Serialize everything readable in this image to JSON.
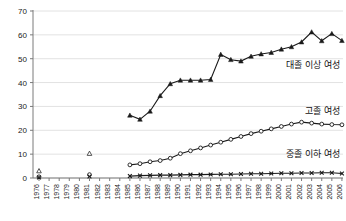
{
  "chart_data": {
    "type": "line",
    "title": "",
    "xlabel": "",
    "ylabel": "",
    "ylim": [
      0,
      70
    ],
    "yticks": [
      0,
      10,
      20,
      30,
      40,
      50,
      60,
      70
    ],
    "grid": true,
    "legend_position": "inline-right",
    "x": [
      1976,
      1977,
      1978,
      1979,
      1980,
      1981,
      1982,
      1983,
      1984,
      1985,
      1986,
      1987,
      1988,
      1989,
      1990,
      1991,
      1992,
      1993,
      1994,
      1995,
      1996,
      1997,
      1998,
      1999,
      2000,
      2001,
      2002,
      2003,
      2004,
      2005,
      2006
    ],
    "categories": [
      "1976",
      "1977",
      "1978",
      "1979",
      "1980",
      "1981",
      "1982",
      "1983",
      "1984",
      "1985",
      "1986",
      "1987",
      "1988",
      "1989",
      "1990",
      "1991",
      "1992",
      "1993",
      "1994",
      "1995",
      "1996",
      "1997",
      "1998",
      "1999",
      "2000",
      "2001",
      "2002",
      "2003",
      "2004",
      "2005",
      "2006"
    ],
    "series": [
      {
        "name": "대졸 이상 여성",
        "marker": "triangle",
        "label_anchor_year": 2001,
        "label_anchor_value": 46,
        "values": [
          3.0,
          null,
          null,
          null,
          null,
          10.3,
          null,
          null,
          null,
          26.3,
          24.6,
          28.0,
          34.5,
          39.5,
          41.0,
          41.0,
          41.0,
          41.3,
          51.8,
          49.6,
          49.0,
          51.0,
          52.0,
          52.6,
          54.0,
          55.0,
          57.0,
          61.2,
          57.5,
          60.5,
          57.6
        ]
      },
      {
        "name": "고졸 여성",
        "marker": "circle",
        "label_anchor_year": 2000,
        "label_anchor_value": 27,
        "values": [
          0.5,
          null,
          null,
          null,
          null,
          1.4,
          null,
          null,
          null,
          5.5,
          6.0,
          6.8,
          7.3,
          8.3,
          10.2,
          11.4,
          12.6,
          13.8,
          15.0,
          16.2,
          17.4,
          18.6,
          19.6,
          20.6,
          21.6,
          22.6,
          23.4,
          23.0,
          22.6,
          22.4,
          22.3
        ]
      },
      {
        "name": "중졸 이하 여성",
        "marker": "x",
        "label_anchor_year": 2000,
        "label_anchor_value": 9,
        "values": [
          0.2,
          null,
          null,
          null,
          null,
          0.6,
          null,
          null,
          null,
          0.8,
          1.0,
          1.1,
          1.2,
          1.2,
          1.3,
          1.4,
          1.4,
          1.5,
          1.6,
          1.6,
          1.7,
          1.8,
          1.8,
          1.9,
          2.0,
          2.0,
          2.1,
          2.1,
          2.2,
          2.2,
          1.9
        ]
      }
    ]
  },
  "labels": {
    "series_college": "대졸 이상 여성",
    "series_highschool": "고졸 여성",
    "series_middleschool": "중졸 이하 여성"
  },
  "colors": {
    "ink": "#1a1a1a",
    "grid": "#e2e2e2",
    "axis": "#7a7a7a",
    "background": "#ffffff"
  }
}
